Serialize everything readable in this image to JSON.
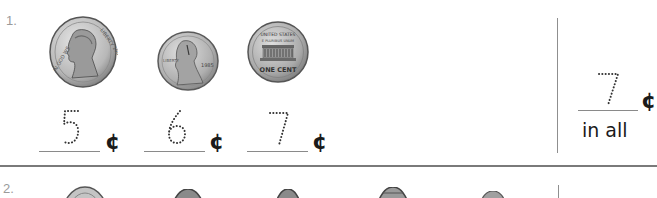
{
  "worksheet": {
    "problems": [
      {
        "number": "1.",
        "coins": [
          {
            "type": "nickel",
            "side": "heads",
            "label": "nickel-icon"
          },
          {
            "type": "penny",
            "side": "heads",
            "year": "1985",
            "label": "penny-heads-icon"
          },
          {
            "type": "penny",
            "side": "tails",
            "inscription": "ONE CENT",
            "label": "penny-tails-icon"
          }
        ],
        "counts": [
          {
            "value": "5",
            "unit": "¢"
          },
          {
            "value": "6",
            "unit": "¢"
          },
          {
            "value": "7",
            "unit": "¢"
          }
        ],
        "total": {
          "value": "7",
          "unit": "¢",
          "label": "in all"
        }
      },
      {
        "number": "2.",
        "coins": [
          {
            "type": "nickel",
            "label": "nickel-icon"
          },
          {
            "type": "penny",
            "label": "penny-icon"
          },
          {
            "type": "penny",
            "label": "penny-icon"
          },
          {
            "type": "penny",
            "label": "penny-icon"
          },
          {
            "type": "penny",
            "label": "penny-icon"
          }
        ]
      }
    ]
  },
  "colors": {
    "rule": "#7a7a7a",
    "text": "#1a1a1a",
    "dotted_digit": "#333333",
    "coin_silver": "#c8c8c8",
    "coin_copper": "#bdbdbd"
  }
}
